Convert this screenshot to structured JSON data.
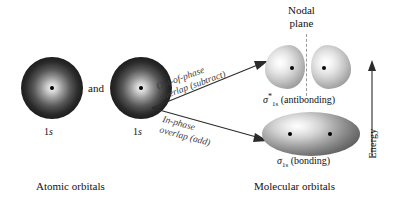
{
  "figure": {
    "background": "#ffffff",
    "domain": "chemistry-orbital-diagram"
  },
  "atomic_orbitals": {
    "caption": "Atomic orbitals",
    "conjunction": "and",
    "items": [
      {
        "label_prefix": "1",
        "label_italic": "s"
      },
      {
        "label_prefix": "1",
        "label_italic": "s"
      }
    ]
  },
  "arrows": [
    {
      "name": "out-of-phase",
      "line1": "Out-of-phase",
      "line2": "overlap (subtract)"
    },
    {
      "name": "in-phase",
      "line1": "In-phase",
      "line2": "overlap (add)"
    }
  ],
  "molecular_orbitals": {
    "caption": "Molecular orbitals",
    "nodal_plane": {
      "line1": "Nodal",
      "line2": "plane"
    },
    "antibonding": {
      "sigma": "σ",
      "star": "*",
      "subscript": "1s",
      "suffix": "(antibonding)"
    },
    "bonding": {
      "sigma": "σ",
      "subscript": "1s",
      "suffix": "(bonding)"
    }
  },
  "energy_axis": {
    "label": "Energy",
    "direction": "up"
  }
}
